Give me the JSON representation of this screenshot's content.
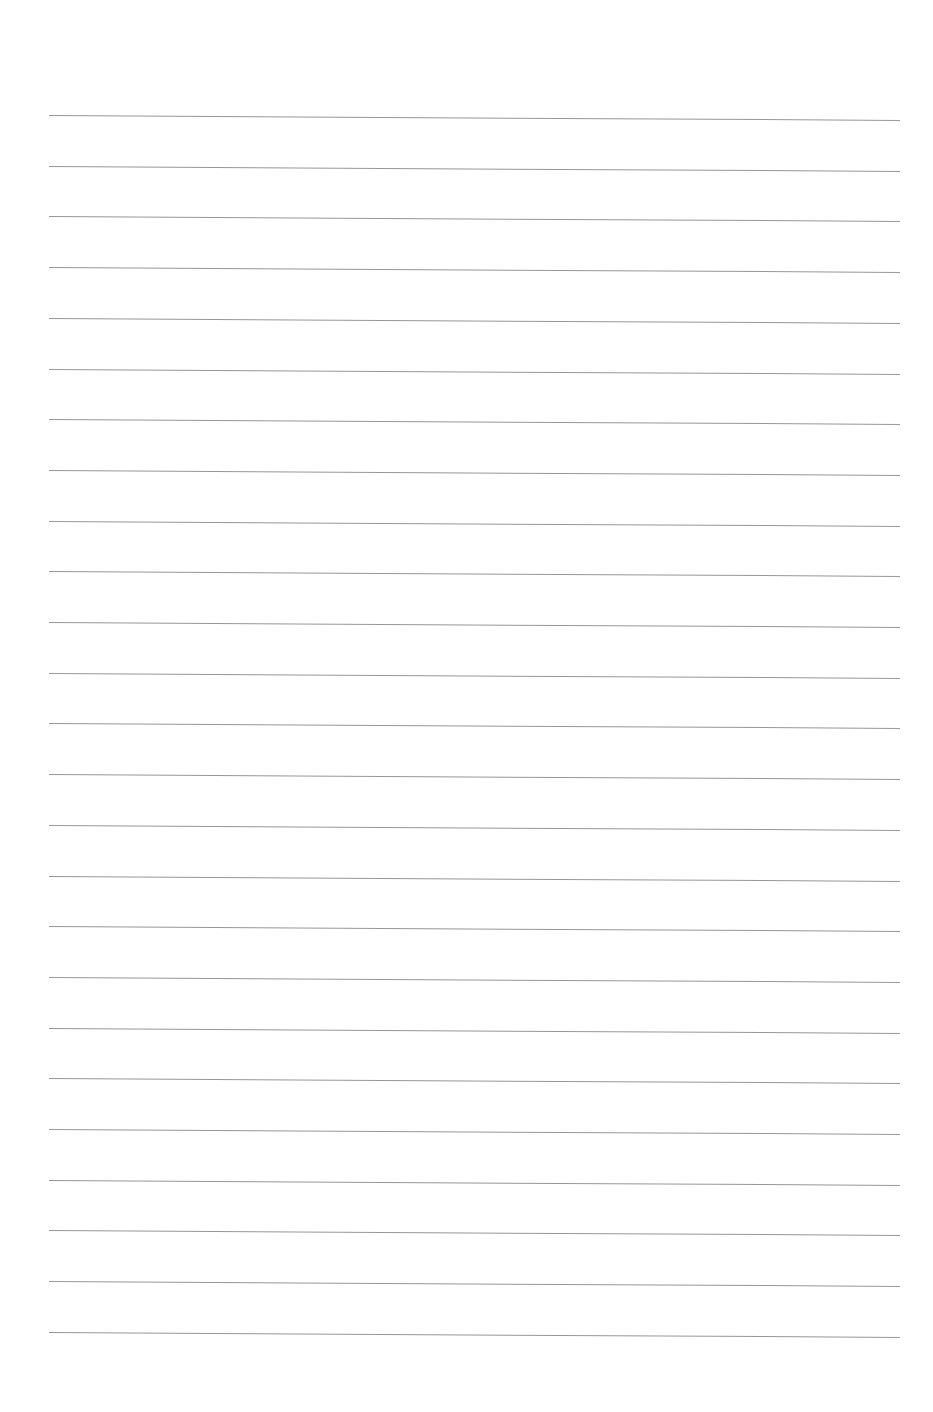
{
  "document": {
    "type": "lined-paper",
    "background_color": "#ffffff",
    "line_color": "#8c8c8c",
    "line_count": 25,
    "first_line_y": 115,
    "line_spacing": 50.7,
    "line_left_x": 49,
    "line_right_x": 900,
    "text": ""
  }
}
